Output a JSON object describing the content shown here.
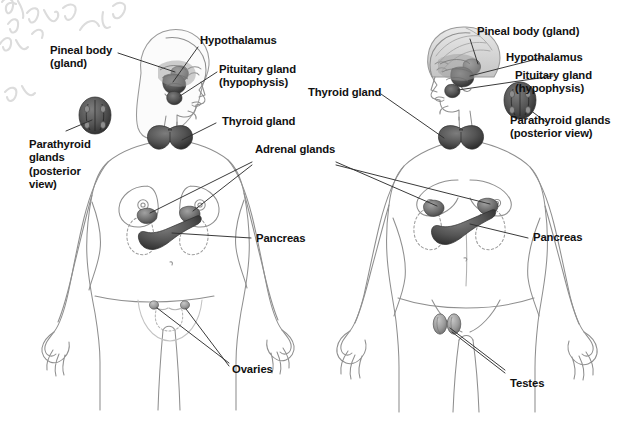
{
  "diagram": {
    "background_color": "#ffffff",
    "text_color": "#111111",
    "line_color": "#3a3a3a",
    "gland_fill": "#4a4a4a",
    "body_outline_color": "#8a8a8a",
    "watermark_color": "#d8d8d8",
    "watermark_text": "e via"
  },
  "figures": [
    {
      "id": "female",
      "name": "female-figure",
      "caption_side": "left"
    },
    {
      "id": "male",
      "name": "male-figure",
      "caption_side": "right"
    }
  ],
  "labels": {
    "left": {
      "pineal": "Pineal body\n(gland)",
      "hypothalamus": "Hypothalamus",
      "pituitary": "Pituitary gland\n(hypophysis)",
      "thyroid": "Thyroid gland",
      "parathyroid": "Parathyroid\nglands\n(posterior\nview)",
      "ovaries": "Ovaries"
    },
    "center": {
      "adrenal": "Adrenal glands",
      "pancreas_left": "Pancreas"
    },
    "right": {
      "pineal": "Pineal body (gland)",
      "hypothalamus": "Hypothalamus",
      "pituitary": "Pituitary gland\n(hypophysis)",
      "thyroid": "Thyroid gland",
      "parathyroid": "Parathyroid glands\n(posterior view)",
      "pancreas": "Pancreas",
      "testes": "Testes"
    }
  },
  "glands": [
    {
      "name": "pineal-body",
      "figures": [
        "female",
        "male"
      ]
    },
    {
      "name": "hypothalamus",
      "figures": [
        "female",
        "male"
      ]
    },
    {
      "name": "pituitary-gland",
      "figures": [
        "female",
        "male"
      ]
    },
    {
      "name": "thyroid-gland",
      "figures": [
        "female",
        "male"
      ]
    },
    {
      "name": "parathyroid-glands",
      "figures": [
        "female",
        "male"
      ]
    },
    {
      "name": "adrenal-glands",
      "figures": [
        "female",
        "male"
      ]
    },
    {
      "name": "pancreas",
      "figures": [
        "female",
        "male"
      ]
    },
    {
      "name": "ovaries",
      "figures": [
        "female"
      ]
    },
    {
      "name": "testes",
      "figures": [
        "male"
      ]
    }
  ]
}
